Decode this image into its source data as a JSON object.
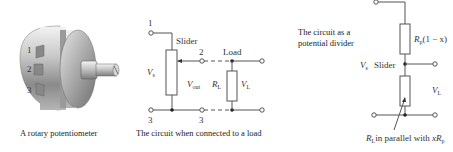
{
  "figures": [
    {
      "id": "rotary-potentiometer",
      "caption": "A rotary potentiometer",
      "terminal_labels": [
        "1",
        "2",
        "3"
      ]
    },
    {
      "id": "circuit-with-load",
      "caption": "The circuit when connected to a load",
      "labels": {
        "terminal_1": "1",
        "terminal_2": "2",
        "terminal_3_left": "3",
        "terminal_3_right": "3",
        "slider": "Slider",
        "load": "Load",
        "vs": "V",
        "vs_sub": "s",
        "vout": "V",
        "vout_sub": "out",
        "rl": "R",
        "rl_sub": "L",
        "vl": "V",
        "vl_sub": "L"
      }
    },
    {
      "id": "potential-divider",
      "caption_line1": "The circuit as a",
      "caption_line2": "potential divider",
      "labels": {
        "rp_upper": "R",
        "rp_upper_sub": "p",
        "rp_upper_suffix": "(1 − x)",
        "vs": "V",
        "vs_sub": "s",
        "slider": "Slider",
        "vl": "V",
        "vl_sub": "L",
        "bottom_note_r": "R",
        "bottom_note_r_sub": "L",
        "bottom_note_text": "in parallel with ",
        "bottom_note_x": "xR",
        "bottom_note_x_sub": "p"
      }
    }
  ]
}
